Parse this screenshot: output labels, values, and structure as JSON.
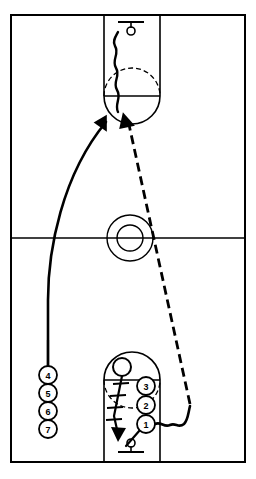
{
  "diagram": {
    "type": "full-court-play",
    "court": {
      "outline_color": "#000000",
      "line_color": "#000000",
      "background_color": "#ffffff",
      "half_court_line": "halfcourt-line",
      "center_circle": "center-circle",
      "top_key": "top-key",
      "bottom_key": "bottom-key",
      "top_basket": "top-basket",
      "bottom_basket": "bottom-basket"
    },
    "players": [
      {
        "id": "p1",
        "number": "1",
        "cx": 146,
        "cy": 424,
        "r": 9
      },
      {
        "id": "p2",
        "number": "2",
        "cx": 146,
        "cy": 405,
        "r": 9
      },
      {
        "id": "p3",
        "number": "3",
        "cx": 146,
        "cy": 386,
        "r": 9
      },
      {
        "id": "p4",
        "number": "4",
        "cx": 48,
        "cy": 375,
        "r": 9
      },
      {
        "id": "p5",
        "number": "5",
        "cx": 48,
        "cy": 393,
        "r": 9
      },
      {
        "id": "p6",
        "number": "6",
        "cx": 48,
        "cy": 411,
        "r": 9
      },
      {
        "id": "p7",
        "number": "7",
        "cx": 48,
        "cy": 429,
        "r": 9
      }
    ],
    "ball": {
      "id": "ball",
      "cx": 122,
      "cy": 367,
      "r": 9
    },
    "movements": [
      {
        "id": "cut-path",
        "style": "solid-arrow",
        "label": "player-cut"
      },
      {
        "id": "pass-path",
        "style": "dashed-arrow",
        "label": "pass"
      },
      {
        "id": "dribble-path",
        "style": "wavy",
        "label": "dribble"
      },
      {
        "id": "screen-path",
        "style": "hatched",
        "label": "screen-line"
      }
    ]
  }
}
